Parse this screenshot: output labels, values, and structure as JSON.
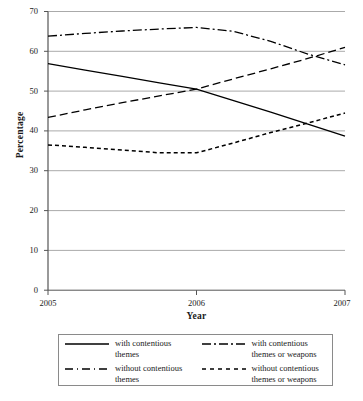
{
  "chart_data": {
    "type": "line",
    "title": "",
    "xlabel": "Year",
    "ylabel": "Percentage",
    "xlim": [
      2005,
      2007
    ],
    "ylim": [
      0,
      70
    ],
    "grid": true,
    "legend_position": "bottom",
    "x_tick_labels": [
      "2005",
      "2006",
      "2007"
    ],
    "y_tick_labels": [
      "0",
      "10",
      "20",
      "30",
      "40",
      "50",
      "60",
      "70"
    ],
    "x": [
      2005,
      2007
    ],
    "series": [
      {
        "name": "with contentious themes",
        "style": "solid",
        "color": "#000000",
        "x": [
          2005,
          2005.25,
          2005.5,
          2005.75,
          2006,
          2006.25,
          2006.5,
          2006.75,
          2007
        ],
        "values": [
          56.9,
          55.3,
          53.7,
          52.1,
          50.5,
          47.6,
          44.7,
          41.7,
          38.7
        ]
      },
      {
        "name": "without contentious themes",
        "style": "dashed",
        "color": "#000000",
        "x": [
          2005,
          2005.25,
          2005.5,
          2005.75,
          2006,
          2006.25,
          2006.5,
          2006.75,
          2007
        ],
        "values": [
          43.4,
          45.3,
          47.1,
          48.8,
          50.5,
          53.1,
          55.6,
          58.2,
          61.0
        ]
      },
      {
        "name": "with contentious themes or weapons",
        "style": "dash-dot",
        "color": "#000000",
        "x": [
          2005,
          2005.25,
          2005.5,
          2005.75,
          2006,
          2006.25,
          2006.5,
          2006.75,
          2007
        ],
        "values": [
          63.8,
          64.5,
          65.1,
          65.6,
          66.0,
          65.0,
          62.5,
          59.3,
          56.6
        ]
      },
      {
        "name": "without contentious themes or weapons",
        "style": "dotted",
        "color": "#000000",
        "x": [
          2005,
          2005.25,
          2005.5,
          2005.75,
          2006,
          2006.25,
          2006.5,
          2006.75,
          2007
        ],
        "values": [
          36.5,
          35.9,
          35.2,
          34.5,
          34.5,
          37.0,
          39.6,
          42.0,
          44.5
        ]
      }
    ]
  },
  "axes": {
    "y_title": "Percentage",
    "x_title": "Year",
    "y_ticks": [
      "70",
      "60",
      "50",
      "40",
      "30",
      "20",
      "10",
      "0"
    ],
    "x_ticks": [
      "2005",
      "2006",
      "2007"
    ]
  },
  "legend": {
    "entries": [
      {
        "label_line1": "with contentious",
        "label_line2": "themes",
        "style": "solid"
      },
      {
        "label_line1": "with contentious",
        "label_line2": "themes or weapons",
        "style": "dash-dot"
      },
      {
        "label_line1": "without contentious",
        "label_line2": "themes",
        "style": "dashed"
      },
      {
        "label_line1": "without contentious",
        "label_line2": "themes or weapons",
        "style": "dotted"
      }
    ]
  },
  "colors": {
    "line": "#000000",
    "grid": "#aaaaaa",
    "axis": "#555555",
    "legend_border": "#8a8a8a",
    "background": "#ffffff"
  }
}
